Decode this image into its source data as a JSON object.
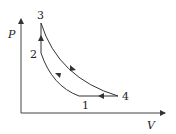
{
  "diagram": {
    "type": "PV cycle",
    "axes": {
      "x_label": "V",
      "y_label": "P"
    },
    "points": [
      {
        "id": "1",
        "label": "1"
      },
      {
        "id": "2",
        "label": "2"
      },
      {
        "id": "3",
        "label": "3"
      },
      {
        "id": "4",
        "label": "4"
      }
    ],
    "processes": [
      {
        "from": "1",
        "to": "2",
        "shape": "curve"
      },
      {
        "from": "2",
        "to": "3",
        "shape": "vertical line"
      },
      {
        "from": "3",
        "to": "4",
        "shape": "curve"
      },
      {
        "from": "4",
        "to": "1",
        "shape": "horizontal line"
      }
    ],
    "colors": {
      "line": "#333333",
      "background": "#ffffff"
    }
  }
}
